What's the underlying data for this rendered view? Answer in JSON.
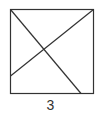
{
  "figure": {
    "label": "3",
    "stroke_color": "#333333",
    "square": {
      "x": 10,
      "y": 9,
      "width": 83,
      "height": 84
    },
    "lines": [
      {
        "name": "diagonal-top-left-to-bottom",
        "x1": 10,
        "y1": 9,
        "x2": 81,
        "y2": 93
      },
      {
        "name": "diagonal-top-right-to-left-side",
        "x1": 93,
        "y1": 9,
        "x2": 10,
        "y2": 76
      }
    ]
  }
}
